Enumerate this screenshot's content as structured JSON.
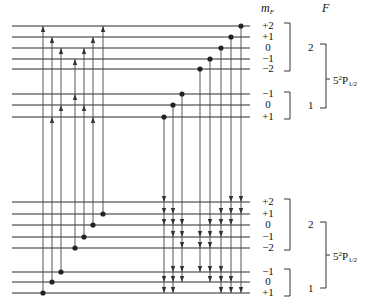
{
  "headers": {
    "mF": "m",
    "mF_sub": "F",
    "F": "F"
  },
  "upper_manifold": {
    "term": {
      "n": "5",
      "mult": "2",
      "L": "P",
      "J": "1/2"
    },
    "F_groups": [
      {
        "F": "2",
        "levels": [
          {
            "m": "+2",
            "y": 26
          },
          {
            "m": "+1",
            "y": 37
          },
          {
            "m": "0",
            "y": 48
          },
          {
            "m": "−1",
            "y": 59
          },
          {
            "m": "−2",
            "y": 69
          }
        ]
      },
      {
        "F": "1",
        "levels": [
          {
            "m": "−1",
            "y": 94
          },
          {
            "m": "0",
            "y": 105
          },
          {
            "m": "+1",
            "y": 117
          }
        ]
      }
    ]
  },
  "lower_manifold": {
    "term": {
      "n": "5",
      "mult": "2",
      "L": "P",
      "J": "1/2"
    },
    "F_groups": [
      {
        "F": "2",
        "levels": [
          {
            "m": "+2",
            "y": 202
          },
          {
            "m": "+1",
            "y": 214
          },
          {
            "m": "0",
            "y": 225
          },
          {
            "m": "−1",
            "y": 237
          },
          {
            "m": "−2",
            "y": 248
          }
        ]
      },
      {
        "F": "1",
        "levels": [
          {
            "m": "−1",
            "y": 272
          },
          {
            "m": "0",
            "y": 282
          },
          {
            "m": "+1",
            "y": 293
          }
        ]
      }
    ]
  },
  "absorption_transitions": [
    {
      "x": 43,
      "from": "L2_+1",
      "to": [
        "U2_+2"
      ]
    },
    {
      "x": 52,
      "from": "L2_0",
      "to": [
        "U2_+1",
        "U1_+1"
      ]
    },
    {
      "x": 61,
      "from": "L2_-1",
      "to": [
        "U2_0",
        "U1_0"
      ]
    },
    {
      "x": 75,
      "from": "L1_-2",
      "to": [
        "U2_-1",
        "U1_-1"
      ]
    },
    {
      "x": 84,
      "from": "L1_-1",
      "to": [
        "U2_0",
        "U1_0"
      ]
    },
    {
      "x": 93,
      "from": "L1_0",
      "to": [
        "U2_+1",
        "U1_+1"
      ]
    },
    {
      "x": 103,
      "from": "L1_+1",
      "to": [
        "U2_+2"
      ]
    }
  ],
  "emission_transitions": [
    {
      "x": 164,
      "from": "U1_+1",
      "to": [
        "L1_+2",
        "L1_+1",
        "L1_0",
        "L2_0",
        "L2_+1"
      ]
    },
    {
      "x": 173,
      "from": "U1_0",
      "to": [
        "L1_+1",
        "L1_0",
        "L1_-1",
        "L2_-1",
        "L2_0",
        "L2_+1"
      ]
    },
    {
      "x": 182,
      "from": "U1_-1",
      "to": [
        "L1_0",
        "L1_-1",
        "L1_-2",
        "L2_-1",
        "L2_0"
      ]
    },
    {
      "x": 200,
      "from": "U2_-2",
      "to": [
        "L1_-1",
        "L1_-2",
        "L2_-1"
      ]
    },
    {
      "x": 210,
      "from": "U2_-1",
      "to": [
        "L1_0",
        "L1_-1",
        "L1_-2",
        "L2_-1",
        "L2_0"
      ]
    },
    {
      "x": 221,
      "from": "U2_0",
      "to": [
        "L1_+1",
        "L1_0",
        "L1_-1",
        "L2_-1",
        "L2_0",
        "L2_+1"
      ]
    },
    {
      "x": 231,
      "from": "U2_+1",
      "to": [
        "L1_+2",
        "L1_+1",
        "L1_0",
        "L2_0",
        "L2_+1"
      ]
    },
    {
      "x": 241,
      "from": "U2_+2",
      "to": [
        "L1_+2",
        "L1_+1",
        "L2_+1"
      ]
    }
  ],
  "labels": {
    "upper_F2": "2",
    "upper_F1": "1",
    "lower_F2": "2",
    "lower_F1": "1",
    "term_prefix": "5",
    "term_sup": "2",
    "term_L": "P",
    "term_sub": "1/2"
  }
}
